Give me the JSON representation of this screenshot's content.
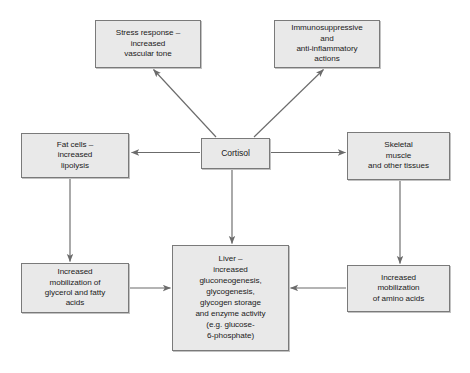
{
  "diagram": {
    "background_color": "#ffffff",
    "box_fill": "#e9e9e9",
    "box_border": "#7a7a7a",
    "arrow_color": "#6b6b6b",
    "text_color": "#1b1b1b",
    "nodes": [
      {
        "id": "stress-response",
        "label": "Stress response –\nincreased\nvascular tone",
        "x": 95,
        "y": 20,
        "w": 106,
        "h": 48
      },
      {
        "id": "immunosuppressive",
        "label": "Immunosuppressive\nand\nanti-inflammatory\nactions",
        "x": 274,
        "y": 20,
        "w": 106,
        "h": 48
      },
      {
        "id": "fat-cells",
        "label": "Fat cells –\nincreased\nlipolysis",
        "x": 21,
        "y": 133,
        "w": 108,
        "h": 45
      },
      {
        "id": "cortisol",
        "label": "Cortisol",
        "x": 201,
        "y": 138,
        "w": 69,
        "h": 31
      },
      {
        "id": "skeletal-muscle",
        "label": "Skeletal\nmuscle\nand other tissues",
        "x": 347,
        "y": 132,
        "w": 103,
        "h": 48
      },
      {
        "id": "glycerol-fatty-acids",
        "label": "Increased\nmobilization of\nglycerol and fatty\nacids",
        "x": 21,
        "y": 263,
        "w": 108,
        "h": 50
      },
      {
        "id": "liver",
        "label": "Liver –\nincreased\ngluconeogenesis,\nglycogenesis,\nglycogen storage\nand enzyme activity\n(e.g. glucose-\n6-phosphate)",
        "x": 172,
        "y": 245,
        "w": 117,
        "h": 106
      },
      {
        "id": "amino-acids",
        "label": "Increased\nmobilization\nof amino acids",
        "x": 347,
        "y": 265,
        "w": 103,
        "h": 47
      }
    ],
    "edges": [
      {
        "id": "cortisol-to-stress-response",
        "from": "cortisol",
        "to": "stress-response",
        "style": "diagonal-up-left"
      },
      {
        "id": "cortisol-to-immunosuppressive",
        "from": "cortisol",
        "to": "immunosuppressive",
        "style": "diagonal-up-right"
      },
      {
        "id": "cortisol-to-fat-cells",
        "from": "cortisol",
        "to": "fat-cells",
        "style": "horizontal-left"
      },
      {
        "id": "cortisol-to-skeletal-muscle",
        "from": "cortisol",
        "to": "skeletal-muscle",
        "style": "horizontal-right"
      },
      {
        "id": "cortisol-to-liver",
        "from": "cortisol",
        "to": "liver",
        "style": "vertical-down"
      },
      {
        "id": "fat-cells-to-glycerol",
        "from": "fat-cells",
        "to": "glycerol-fatty-acids",
        "style": "vertical-down"
      },
      {
        "id": "skeletal-muscle-to-amino-acids",
        "from": "skeletal-muscle",
        "to": "amino-acids",
        "style": "vertical-down"
      },
      {
        "id": "glycerol-to-liver",
        "from": "glycerol-fatty-acids",
        "to": "liver",
        "style": "horizontal-right"
      },
      {
        "id": "amino-acids-to-liver",
        "from": "amino-acids",
        "to": "liver",
        "style": "horizontal-left"
      }
    ]
  }
}
